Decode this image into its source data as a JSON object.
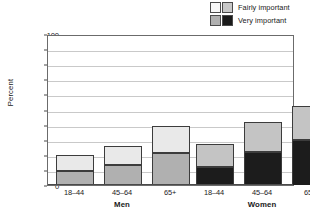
{
  "chart_data": {
    "type": "bar",
    "subtype": "stacked-grouped",
    "title": "",
    "xlabel": "",
    "ylabel": "Percent",
    "ylim": [
      0,
      100
    ],
    "ytick_step": 10,
    "yticks": [
      "0",
      "10",
      "20",
      "30",
      "40",
      "50",
      "60",
      "70",
      "80",
      "90",
      "100"
    ],
    "grid": true,
    "legend_position": "top-right",
    "groups": [
      {
        "name": "Men",
        "categories": [
          "18–44",
          "45–64",
          "65+"
        ],
        "series": [
          {
            "name": "Very important",
            "values": [
              9,
              13,
              21
            ]
          },
          {
            "name": "Fairly important",
            "values": [
              11,
              13,
              18
            ]
          }
        ],
        "totals": [
          20,
          26,
          39
        ]
      },
      {
        "name": "Women",
        "categories": [
          "18–44",
          "45–64",
          "65+"
        ],
        "series": [
          {
            "name": "Very important",
            "values": [
              12,
              22,
              30
            ]
          },
          {
            "name": "Fairly important",
            "values": [
              15,
              20,
              22
            ]
          }
        ],
        "totals": [
          27,
          42,
          52
        ]
      }
    ],
    "legend": [
      {
        "label": "Fairly important",
        "swatches": [
          "#f2f2f2",
          "#c8c8c8"
        ]
      },
      {
        "label": "Very important",
        "swatches": [
          "#b0b0b0",
          "#1a1a1a"
        ]
      }
    ],
    "colors": {
      "men_very": "#b0b0b0",
      "men_fairly": "#e9e9e9",
      "women_very": "#1c1c1c",
      "women_fairly": "#c4c4c4",
      "grid": "#c9c9c9",
      "axis": "#4a4a4a",
      "bar_outline": "#3c3c3c"
    }
  }
}
